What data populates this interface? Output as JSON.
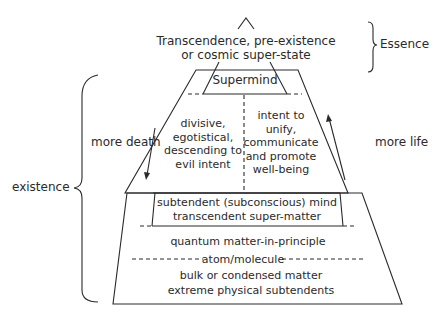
{
  "diagram": {
    "top_label": {
      "line1": "Transcendence, pre-existence",
      "line2": "or cosmic super-state"
    },
    "essence_label": "Essence",
    "existence_label": "existence",
    "supermind_label": "Supermind",
    "left_column": {
      "line1": "divisive,",
      "line2": "egotistical,",
      "line3": "descending to",
      "line4": "evil intent"
    },
    "right_column": {
      "line1": "intent to",
      "line2": "unify,",
      "line3": "communicate",
      "line4": "and promote",
      "line5": "well-being"
    },
    "more_death_label": "more death",
    "more_life_label": "more life",
    "subtendent_box": {
      "line1": "subtendent (subconscious) mind",
      "line2": "transcendent super-matter"
    },
    "quantum_label": "quantum matter-in-principle",
    "atom_label": "atom/molecule",
    "bulk": {
      "line1": "bulk or condensed matter",
      "line2": "extreme physical subtendents"
    },
    "line_color": "#2a2a2a"
  }
}
